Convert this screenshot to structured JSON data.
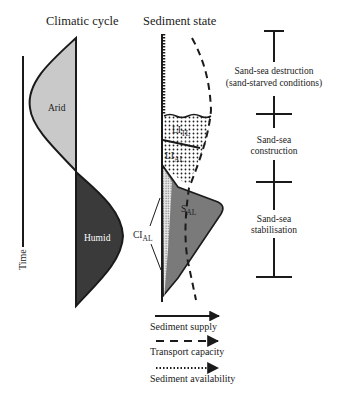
{
  "titles": {
    "climatic_cycle": "Climatic cycle",
    "sediment_state": "Sediment state"
  },
  "climate": {
    "arid_label": "Arid",
    "humid_label": "Humid",
    "time_axis_label": "Time",
    "colors": {
      "arid": "#c9c9c9",
      "humid": "#3a3a3a"
    }
  },
  "sediment": {
    "li_tl": {
      "main": "LI",
      "sub": "TL"
    },
    "li_al": {
      "main": "LI",
      "sub": "AL"
    },
    "s_al": {
      "main": "S",
      "sub": "AL"
    },
    "ci_al": {
      "main": "CI",
      "sub": "AL"
    },
    "colors": {
      "supply_fill": "#7a7a7a",
      "stipple_bg": "#d8d8d8"
    }
  },
  "phases": [
    {
      "line1": "Sand-sea destruction",
      "line2": "(sand-starved conditions)"
    },
    {
      "line1": "Sand-sea",
      "line2": "construction"
    },
    {
      "line1": "Sand-sea",
      "line2": "stabilisation"
    }
  ],
  "legend": [
    {
      "label": "Sediment supply",
      "style": "solid"
    },
    {
      "label": "Transport capacity",
      "style": "dashed"
    },
    {
      "label": "Sediment availability",
      "style": "dotted"
    }
  ]
}
